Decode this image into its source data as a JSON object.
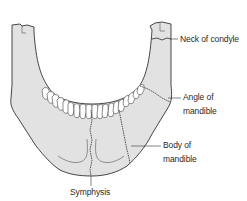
{
  "figure": {
    "colors": {
      "bone_fill": "#e2e2e2",
      "outline": "#333333",
      "teeth_fill": "#ffffff",
      "fracture_line": "#444444",
      "leader_line": "#333333",
      "label_text": "#2a2a2a"
    }
  },
  "labels": {
    "neck_of_condyle": "Neck of condyle",
    "angle_of_mandible_line1": "Angle of",
    "angle_of_mandible_line2": "mandible",
    "body_of_mandible_line1": "Body of",
    "body_of_mandible_line2": "mandible",
    "symphysis": "Symphysis"
  }
}
